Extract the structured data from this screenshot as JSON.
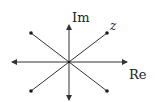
{
  "diagram": {
    "type": "complex-plane",
    "labels": {
      "imaginary_axis": "Im",
      "real_axis": "Re",
      "point": "z"
    },
    "colors": {
      "stroke": "#333333",
      "dot": "#1a1a1a",
      "background": "#ffffff"
    },
    "center": [
      69,
      62
    ],
    "points": [
      {
        "name": "z",
        "x": 107,
        "y": 33
      },
      {
        "name": "upper-left",
        "x": 31,
        "y": 33
      },
      {
        "name": "lower-left",
        "x": 31,
        "y": 91
      },
      {
        "name": "lower-right",
        "x": 107,
        "y": 91
      }
    ]
  }
}
